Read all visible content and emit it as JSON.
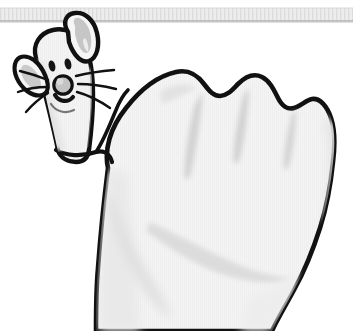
{
  "illustration": {
    "title": "Hand puppet mouse",
    "description": "Cartoon line drawing of a closed fist seen from the side with the thumb raised and drawn as a mouse face",
    "style": "black ink outline with light grey shading on white background",
    "background_color": "#ffffff"
  },
  "palette": {
    "outline": "#111111",
    "skin_fill": "#f2f2f2",
    "skin_fill_light": "#f7f7f7",
    "shading_grey": "#d8d8d8",
    "shading_grey_soft": "#e4e4e4",
    "ear_inner": "#c9c9c9",
    "nose_fill": "#c4c4c4",
    "band_fill": "#ededed",
    "band_line": "#b8b8b8",
    "band_stripe": "#dcdcdc",
    "white": "#ffffff"
  },
  "shelf_band": {
    "label": "Table edge band",
    "top": 8,
    "height": 14,
    "stripe_count": 88,
    "visible": true
  },
  "hand": {
    "label": "Closed fist",
    "knuckle_count": 4,
    "knuckle_labels": [
      "index-knuckle",
      "middle-knuckle",
      "ring-knuckle",
      "little-knuckle"
    ],
    "finger_crease_count": 3,
    "cropped_at_bottom": true
  },
  "thumb": {
    "label": "Raised thumb",
    "orientation": "up",
    "base_crease": true
  },
  "mouse_face": {
    "label": "Mouse face drawn on thumb",
    "features": [
      {
        "name": "left-ear",
        "note": "small ear on far side"
      },
      {
        "name": "right-ear",
        "note": "large tilted oval ear"
      },
      {
        "name": "left-eye",
        "note": "slanted oval dot"
      },
      {
        "name": "right-eye",
        "note": "slanted oval dot"
      },
      {
        "name": "nose",
        "note": "round grey snout"
      },
      {
        "name": "mouth",
        "note": "short curved smile"
      },
      {
        "name": "whiskers",
        "note": "three whiskers each side"
      }
    ],
    "whisker_count_per_side": 3,
    "eye_count": 2,
    "ear_count": 2
  }
}
